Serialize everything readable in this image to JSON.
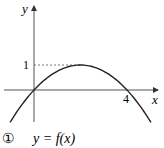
{
  "figure": {
    "axis_x_label": "x",
    "axis_y_label": "y",
    "tick_y_label": "1",
    "tick_x_label": "4",
    "caption_number": "①",
    "caption_text": "y = f(x)",
    "curve": {
      "type": "parabola",
      "equation": "y = x(4 - x)/4",
      "vertex": [
        2,
        1
      ],
      "x_intercepts": [
        0,
        4
      ],
      "x_range": [
        -1.03,
        5.03
      ]
    },
    "line_color": "#222222",
    "axis_color": "#555555"
  }
}
